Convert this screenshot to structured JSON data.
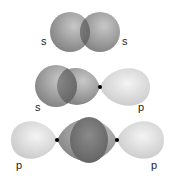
{
  "diagram": {
    "rows": [
      {
        "name": "s-s overlap",
        "labels": [
          "s",
          "s"
        ]
      },
      {
        "name": "s-p overlap",
        "labels": [
          "s",
          "p"
        ]
      },
      {
        "name": "p-p overlap",
        "labels": [
          "p",
          "p"
        ]
      }
    ],
    "colors": {
      "s_orbital": "#8f8f8f",
      "p_orbital": "#d8d8d8",
      "overlap": "#6e6e6e",
      "node": "#000000"
    }
  }
}
